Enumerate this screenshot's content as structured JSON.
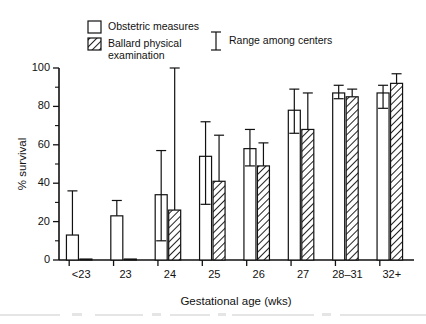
{
  "chart_data": {
    "type": "bar",
    "title": "",
    "xlabel": "Gestational age (wks)",
    "ylabel": "% survival",
    "ylim": [
      0,
      100
    ],
    "yticks": [
      0,
      20,
      40,
      60,
      80,
      100
    ],
    "yticklabels": [
      "0",
      "20",
      "40",
      "60",
      "80",
      "100"
    ],
    "minor_tick_interval": 10,
    "grid": false,
    "categories": [
      "<23",
      "23",
      "24",
      "25",
      "26",
      "27",
      "28–31",
      "32+"
    ],
    "legend": {
      "position": "top-left",
      "entries": [
        {
          "label": "Obstetric measures",
          "style": "open-box"
        },
        {
          "label": "Ballard physical examination",
          "style": "hatched-box"
        },
        {
          "label": "Range among centers",
          "style": "error-bar"
        }
      ]
    },
    "series": [
      {
        "name": "Obstetric measures",
        "style": "open-box",
        "values": [
          13,
          23,
          34,
          54,
          58,
          78,
          87,
          87
        ],
        "range_low": [
          0,
          0,
          10,
          29,
          49,
          66,
          84,
          79
        ],
        "range_high": [
          36,
          31,
          57,
          72,
          68,
          89,
          91,
          91
        ]
      },
      {
        "name": "Ballard physical examination",
        "style": "hatched-box",
        "values": [
          0.5,
          0.5,
          26,
          41,
          49,
          68,
          85,
          92
        ],
        "range_low": [
          0,
          0,
          0,
          0,
          0,
          0,
          0,
          0
        ],
        "range_high": [
          0.5,
          0.5,
          100,
          65,
          61,
          87,
          89,
          97
        ]
      }
    ]
  },
  "figure": {
    "legend_label_1": "Obstetric measures",
    "legend_label_2a": "Ballard physical",
    "legend_label_2b": "examination",
    "legend_label_3": "Range among centers",
    "y_axis_title": "% survival",
    "x_axis_title": "Gestational age (wks)",
    "y_tick_0": "0",
    "y_tick_20": "20",
    "y_tick_40": "40",
    "y_tick_60": "60",
    "y_tick_80": "80",
    "y_tick_100": "100",
    "x_tick_0": "<23",
    "x_tick_1": "23",
    "x_tick_2": "24",
    "x_tick_3": "25",
    "x_tick_4": "26",
    "x_tick_5": "27",
    "x_tick_6": "28–31",
    "x_tick_7": "32+"
  },
  "colors": {
    "ink": "#111111",
    "page": "#ffffff",
    "hatch": "#222222"
  }
}
